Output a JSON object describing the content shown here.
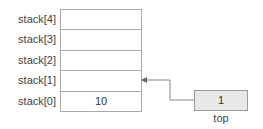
{
  "stack": {
    "rows": [
      {
        "label": "stack[4]",
        "value": ""
      },
      {
        "label": "stack[3]",
        "value": ""
      },
      {
        "label": "stack[2]",
        "value": ""
      },
      {
        "label": "stack[1]",
        "value": ""
      },
      {
        "label": "stack[0]",
        "value": "10"
      }
    ]
  },
  "top": {
    "value": "1",
    "label": "top",
    "points_to": "stack[1]"
  },
  "colors": {
    "border": "#aaaaaa",
    "top_fill": "#e8e8e8",
    "arrow": "#888888"
  }
}
